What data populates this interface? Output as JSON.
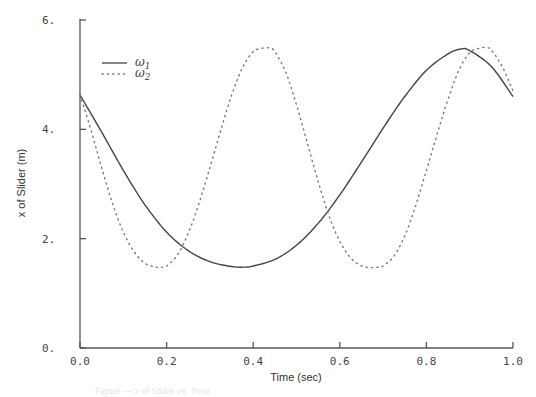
{
  "chart_data": {
    "type": "line",
    "title": "",
    "xlabel": "Time (sec)",
    "ylabel": "x  of  Slider (m)",
    "xlim": [
      0.0,
      1.0
    ],
    "ylim": [
      0.0,
      6.0
    ],
    "grid": false,
    "legend_position": "upper-left",
    "x_ticks": [
      "0.0",
      "0.2",
      "0.4",
      "0.6",
      "0.8",
      "1.0"
    ],
    "y_ticks": [
      "0.",
      "2.",
      "4.",
      "6."
    ],
    "x": [
      0.0,
      0.05,
      0.1,
      0.15,
      0.2,
      0.25,
      0.3,
      0.35,
      0.38,
      0.4,
      0.45,
      0.5,
      0.55,
      0.6,
      0.65,
      0.7,
      0.75,
      0.8,
      0.85,
      0.88,
      0.9,
      0.95,
      1.0
    ],
    "series": [
      {
        "name": "ω1",
        "legend_main": "ω",
        "legend_sub": "1",
        "style": "solid",
        "values": [
          4.63,
          3.95,
          3.25,
          2.62,
          2.12,
          1.78,
          1.58,
          1.49,
          1.48,
          1.5,
          1.62,
          1.88,
          2.28,
          2.8,
          3.4,
          4.02,
          4.6,
          5.08,
          5.38,
          5.47,
          5.44,
          5.15,
          4.6
        ]
      },
      {
        "name": "ω2",
        "legend_main": "ω",
        "legend_sub": "2",
        "style": "dotted",
        "x": [
          0.0,
          0.025,
          0.05,
          0.075,
          0.1,
          0.125,
          0.15,
          0.175,
          0.19,
          0.2,
          0.225,
          0.25,
          0.275,
          0.3,
          0.325,
          0.35,
          0.375,
          0.4,
          0.425,
          0.44,
          0.45,
          0.475,
          0.5,
          0.525,
          0.55,
          0.575,
          0.6,
          0.625,
          0.65,
          0.675,
          0.69,
          0.7,
          0.725,
          0.75,
          0.775,
          0.8,
          0.825,
          0.85,
          0.875,
          0.9,
          0.925,
          0.94,
          0.95,
          0.975,
          1.0
        ],
        "values": [
          4.63,
          4.0,
          3.3,
          2.65,
          2.12,
          1.76,
          1.55,
          1.48,
          1.48,
          1.5,
          1.7,
          2.1,
          2.65,
          3.3,
          3.98,
          4.62,
          5.12,
          5.42,
          5.49,
          5.48,
          5.42,
          5.05,
          4.45,
          3.75,
          3.05,
          2.42,
          1.95,
          1.65,
          1.5,
          1.47,
          1.48,
          1.5,
          1.68,
          2.05,
          2.6,
          3.25,
          3.92,
          4.55,
          5.08,
          5.4,
          5.49,
          5.49,
          5.45,
          5.15,
          4.7
        ]
      }
    ]
  },
  "caption": "Figure — x of Slider vs. Time"
}
